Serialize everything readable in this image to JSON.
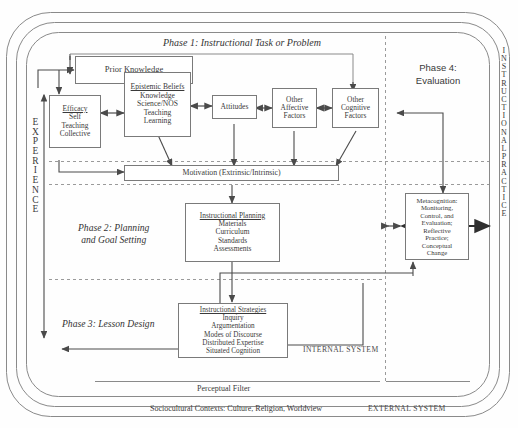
{
  "figure": {
    "title_internal": "INTERNAL SYSTEM",
    "title_external": "EXTERNAL SYSTEM",
    "perceptual_filter": "Perceptual Filter",
    "sociocultural": "Sociocultural Contexts: Culture, Religion, Worldview"
  },
  "phases": {
    "phase1": "Phase 1:  Instructional Task or Problem",
    "phase2": "Phase 2:  Planning\nand Goal Setting",
    "phase2_line1": "Phase 2:  Planning",
    "phase2_line2": "and Goal Setting",
    "phase3": "Phase 3: Lesson Design",
    "phase4_line1": "Phase 4:",
    "phase4_line2": "Evaluation"
  },
  "vertical": {
    "left_label": "EXPERIENCE",
    "left_letters": [
      "E",
      "X",
      "P",
      "E",
      "R",
      "I",
      "E",
      "N",
      "C",
      "E"
    ],
    "right_label": "INSTRUCTIONAL PRACTICE",
    "right_letters": [
      "I",
      "N",
      "S",
      "T",
      "R",
      "U",
      "C",
      "T",
      "I",
      "O",
      "N",
      "A",
      "L",
      "P",
      "R",
      "A",
      "C",
      "T",
      "I",
      "C",
      "E"
    ]
  },
  "boxes": {
    "prior_knowledge": {
      "title": "Prior Knowledge",
      "items": []
    },
    "epistemic_beliefs": {
      "title": "Epistemic Beliefs",
      "items": [
        "Knowledge",
        "Science/NOS",
        "Teaching",
        "Learning"
      ]
    },
    "efficacy": {
      "title": "Efficacy",
      "items": [
        "Self",
        "Teaching",
        "Collective"
      ]
    },
    "attitudes": {
      "title": "Attitudes",
      "items": []
    },
    "other_affective": {
      "title": "Other\nAffective\nFactors",
      "lines": [
        "Other",
        "Affective",
        "Factors"
      ]
    },
    "other_cognitive": {
      "title": "Other\nCognitive\nFactors",
      "lines": [
        "Other",
        "Cognitive",
        "Factors"
      ]
    },
    "motivation": {
      "title": "Motivation (Extrinsic/Intrinsic)"
    },
    "instructional_planning": {
      "title": "Instructional Planning",
      "items": [
        "Materials",
        "Curriculum",
        "Standards",
        "Assessments"
      ]
    },
    "instructional_strategies": {
      "title": "Instructional Strategies",
      "items": [
        "Inquiry",
        "Argumentation",
        "Modes of Discourse",
        "Distributed Expertise",
        "Situated Cognition"
      ]
    },
    "metacognition": {
      "lines": [
        "Metacognition:",
        "Monitoring,",
        "Control, and",
        "Evaluation;",
        "Reflective",
        "Practice;",
        "Conceptual",
        "Change"
      ]
    }
  },
  "colors": {
    "box_border": "#7a7a7a",
    "frame_border": "#8a8a8a",
    "overlap_fill": "#6f6f6f",
    "arrow": "#4a4a4a",
    "dashed": "#9a9a9a",
    "text": "#3a3a3a",
    "background": "#fefefe"
  }
}
